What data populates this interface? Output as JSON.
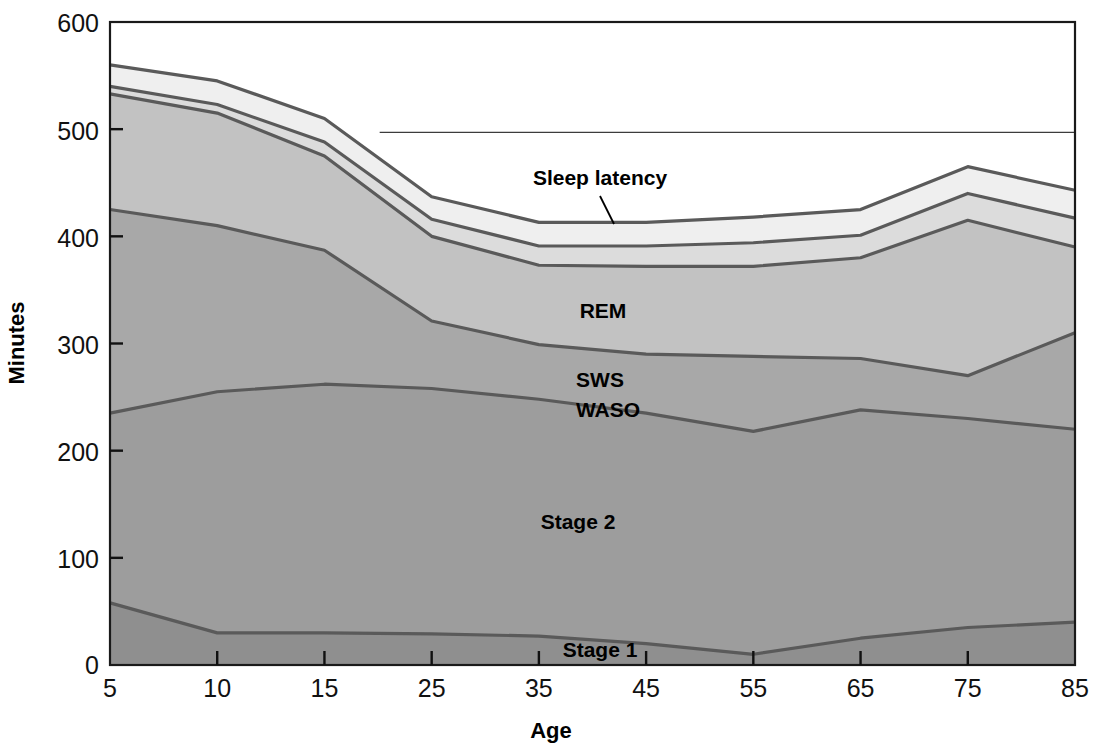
{
  "chart_data": {
    "type": "area",
    "title": "",
    "xlabel": "Age",
    "ylabel": "Minutes",
    "categories": [
      "5",
      "10",
      "15",
      "25",
      "35",
      "45",
      "55",
      "65",
      "75",
      "85"
    ],
    "x_tick_labels": [
      "5",
      "10",
      "15",
      "25",
      "35",
      "45",
      "55",
      "65",
      "75",
      "85"
    ],
    "y_tick_labels": [
      "0",
      "100",
      "200",
      "300",
      "400",
      "500",
      "600"
    ],
    "y_ticks": [
      0,
      100,
      200,
      300,
      400,
      500,
      600
    ],
    "ylim": [
      0,
      600
    ],
    "grid": false,
    "legend_position": "inline-annotations",
    "stacked": true,
    "series": [
      {
        "name": "Stage 1",
        "label": "Stage 1",
        "color": "#8f8f8f",
        "values": [
          58,
          30,
          30,
          29,
          27,
          20,
          10,
          25,
          35,
          40
        ]
      },
      {
        "name": "Stage 2",
        "label": "Stage 2",
        "color": "#9d9d9d",
        "values": [
          177,
          225,
          232,
          229,
          221,
          215,
          208,
          213,
          195,
          180
        ]
      },
      {
        "name": "SWS",
        "label": "SWS",
        "color": "#a8a8a8",
        "values": [
          190,
          155,
          125,
          63,
          51,
          55,
          70,
          48,
          40,
          90
        ]
      },
      {
        "name": "REM",
        "label": "REM",
        "color": "#c2c2c2",
        "values": [
          108,
          105,
          88,
          79,
          74,
          82,
          84,
          94,
          145,
          80
        ]
      },
      {
        "name": "WASO",
        "label": "WASO",
        "color": "#dcdcdc",
        "values": [
          7,
          8,
          13,
          16,
          18,
          19,
          22,
          21,
          25,
          27
        ]
      },
      {
        "name": "Sleep latency",
        "label": "Sleep latency",
        "color": "#efefef",
        "values": [
          20,
          22,
          22,
          21,
          22,
          22,
          24,
          24,
          25,
          26
        ]
      }
    ],
    "cumulative_tops": {
      "stage1": [
        58,
        30,
        30,
        29,
        27,
        20,
        10,
        25,
        35,
        40
      ],
      "stage2": [
        235,
        255,
        262,
        258,
        248,
        235,
        218,
        238,
        230,
        220
      ],
      "sws": [
        425,
        410,
        387,
        321,
        299,
        290,
        288,
        286,
        270,
        310
      ],
      "rem": [
        533,
        515,
        475,
        400,
        373,
        372,
        372,
        380,
        415,
        390
      ],
      "waso": [
        540,
        523,
        488,
        416,
        391,
        391,
        394,
        401,
        440,
        417
      ],
      "latency": [
        560,
        545,
        510,
        437,
        413,
        413,
        418,
        425,
        465,
        443
      ]
    },
    "reference_line": {
      "label": "",
      "value": 497,
      "x_start_category_index": 3,
      "visible": true
    },
    "annotations": [
      {
        "text": "Sleep latency",
        "x_px": 600,
        "y_px": 178,
        "leader": true
      },
      {
        "text": "WASO",
        "x_px": 607,
        "y_px": 409,
        "leader": false
      },
      {
        "text": "REM",
        "x_px": 603,
        "y_px": 311,
        "leader": false
      },
      {
        "text": "SWS",
        "x_px": 600,
        "y_px": 380,
        "leader": false
      },
      {
        "text": "Stage 2",
        "x_px": 578,
        "y_px": 522,
        "leader": false
      },
      {
        "text": "Stage 1",
        "x_px": 600,
        "y_px": 650,
        "leader": false
      }
    ]
  },
  "labels": {
    "y_axis_title": "Minutes",
    "x_axis_title": "Age",
    "sleep_latency": "Sleep latency",
    "waso": "WASO",
    "rem": "REM",
    "sws": "SWS",
    "stage2": "Stage 2",
    "stage1": "Stage 1"
  },
  "y_tick_text": {
    "t600": "600",
    "t500": "500",
    "t400": "400",
    "t300": "300",
    "t200": "200",
    "t100": "100",
    "t0": "0"
  },
  "x_tick_text": {
    "c0": "5",
    "c1": "10",
    "c2": "15",
    "c3": "25",
    "c4": "35",
    "c5": "45",
    "c6": "55",
    "c7": "65",
    "c8": "75",
    "c9": "85"
  },
  "colors": {
    "stage1": "#8f8f8f",
    "stage2": "#9d9d9d",
    "sws": "#a8a8a8",
    "rem": "#c2c2c2",
    "waso": "#dcdcdc",
    "latency": "#efefef",
    "above": "#ffffff",
    "line": "#5a5a5a",
    "frame": "#1a1a1a",
    "text": "#000000"
  }
}
